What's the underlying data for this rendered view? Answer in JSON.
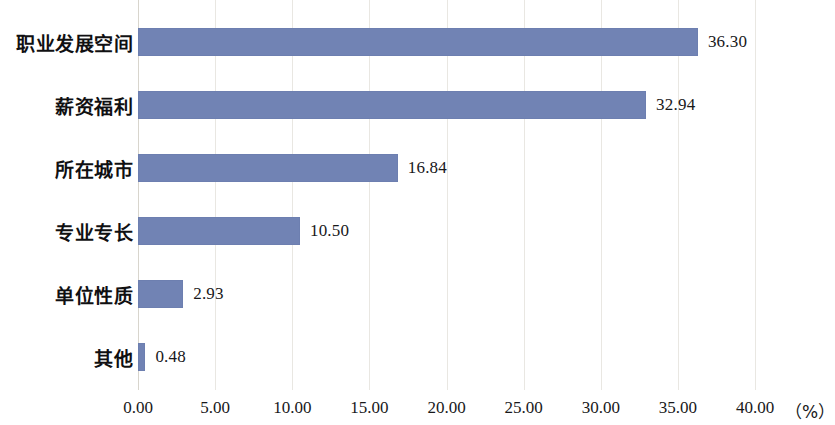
{
  "chart_data": {
    "type": "bar",
    "orientation": "horizontal",
    "title": "",
    "subtitle": "",
    "xlabel": "（%）",
    "ylabel": "",
    "categories": [
      "职业发展空间",
      "薪资福利",
      "所在城市",
      "专业专长",
      "单位性质",
      "其他"
    ],
    "values": [
      36.3,
      32.94,
      16.84,
      10.5,
      2.93,
      0.48
    ],
    "value_labels": [
      "36.30",
      "32.94",
      "16.84",
      "10.50",
      "2.93",
      "0.48"
    ],
    "xlim": [
      0,
      40
    ],
    "xticks": [
      0,
      5,
      10,
      15,
      20,
      25,
      30,
      35,
      40
    ],
    "xtick_labels": [
      "0.00",
      "5.00",
      "10.00",
      "15.00",
      "20.00",
      "25.00",
      "30.00",
      "35.00",
      "40.00"
    ],
    "grid": "vertical",
    "legend": "none",
    "series": [
      {
        "name": "",
        "values": [
          36.3,
          32.94,
          16.84,
          10.5,
          2.93,
          0.48
        ]
      }
    ],
    "colors": {
      "bar": "#7183b4",
      "bar_border": "#6d7fb0",
      "gridline": "#e9e7e2",
      "axis": "#d8d5cd",
      "text": "#18181a",
      "background": "#ffffff"
    }
  }
}
